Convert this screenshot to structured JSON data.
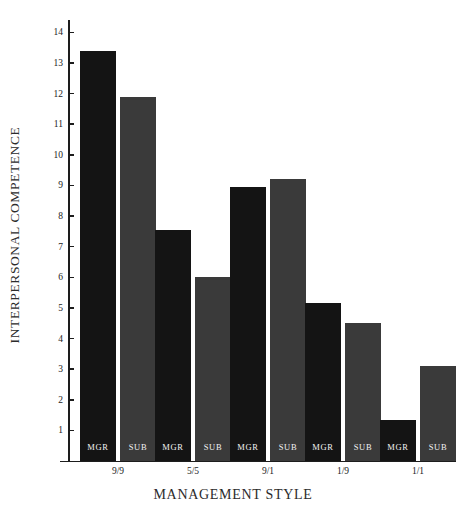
{
  "chart_data": {
    "type": "bar",
    "title": "",
    "xlabel": "MANAGEMENT STYLE",
    "ylabel": "INTERPERSONAL COMPETENCE",
    "categories": [
      "9/9",
      "5/5",
      "9/1",
      "1/9",
      "1/1"
    ],
    "series": [
      {
        "name": "MGR",
        "values": [
          13.4,
          7.55,
          8.95,
          5.15,
          1.35
        ],
        "color": "#141414"
      },
      {
        "name": "SUB",
        "values": [
          11.9,
          6.0,
          9.2,
          4.5,
          3.1
        ],
        "color": "#3a3a3a"
      }
    ],
    "ylim": [
      0,
      14.4
    ],
    "yticks": [
      14,
      13,
      12,
      11,
      10,
      9,
      8,
      7,
      6,
      5,
      4,
      3,
      2,
      1
    ],
    "ytick_labels": [
      "14",
      "13",
      "12",
      "11",
      "10",
      "9",
      "8",
      "7",
      "6",
      "5",
      "4",
      "3",
      "2",
      "1"
    ],
    "grid": false,
    "legend": "none",
    "bar_labels_inside": true
  },
  "axis": {
    "y_title": "INTERPERSONAL COMPETENCE",
    "x_title": "MANAGEMENT STYLE"
  }
}
